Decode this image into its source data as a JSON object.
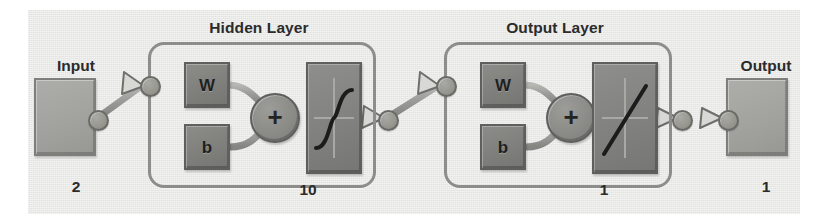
{
  "diagram": {
    "background_color": "#e9e9e7",
    "ink_color": "#2b2b2b",
    "block_color": "#a2a29f",
    "param_color": "#7f7f7c",
    "wire_color": "#9a9a97"
  },
  "input": {
    "title": "Input",
    "count": "2"
  },
  "hidden_layer": {
    "title": "Hidden Layer",
    "count": "10",
    "weight_label": "W",
    "bias_label": "b",
    "sum_label": "+",
    "activation": "sigmoid"
  },
  "output_layer": {
    "title": "Output Layer",
    "count": "1",
    "weight_label": "W",
    "bias_label": "b",
    "sum_label": "+",
    "activation": "linear"
  },
  "output": {
    "title": "Output",
    "count": "1"
  }
}
